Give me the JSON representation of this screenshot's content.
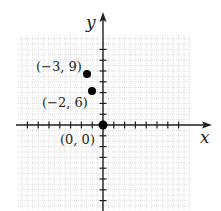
{
  "chart_data": {
    "type": "scatter",
    "title": "",
    "xlabel": "x",
    "ylabel": "y",
    "grid": true,
    "points": [
      {
        "x": -3,
        "y": 9,
        "label": "(−3, 9)"
      },
      {
        "x": -2,
        "y": 6,
        "label": "(−2, 6)"
      },
      {
        "x": 0,
        "y": 0,
        "label": "(0, 0)"
      }
    ],
    "x_tick_step": 1,
    "y_tick_step": 3,
    "xlim": [
      -8,
      8
    ],
    "ylim": [
      -25,
      26
    ]
  },
  "labels": {
    "x_axis": "x",
    "y_axis": "y",
    "p1": "(−3, 9)",
    "p2": "(−2, 6)",
    "p3": "(0, 0)"
  },
  "colors": {
    "axis": "#231f20",
    "grid": "#c8c8c8",
    "point": "#000000"
  }
}
